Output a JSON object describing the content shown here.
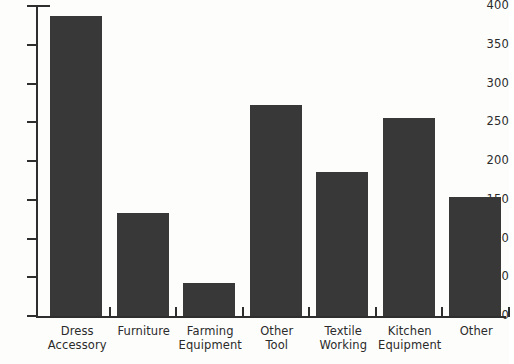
{
  "chart_data": {
    "type": "bar",
    "title": "",
    "subtitle": "",
    "xlabel": "",
    "ylabel": "",
    "ylim": [
      0,
      400
    ],
    "y_ticks": [
      0,
      50,
      100,
      150,
      200,
      250,
      300,
      350,
      400
    ],
    "grid": false,
    "legend": false,
    "legend_position": "none",
    "orientation": "vertical",
    "bar_color": "#383838",
    "background_color": "#fdfdfc",
    "axis_color": "#2e2e2e",
    "categories": [
      "Dress Accessory",
      "Furniture",
      "Farming Equipment",
      "Other Tool",
      "Textile Working",
      "Kitchen Equipment",
      "Other"
    ],
    "category_lines": [
      [
        "Dress",
        "Accessory"
      ],
      [
        "Furniture",
        ""
      ],
      [
        "Farming",
        "Equipment"
      ],
      [
        "Other",
        "Tool"
      ],
      [
        "Textile",
        "Working"
      ],
      [
        "Kitchen",
        "Equipment"
      ],
      [
        "Other",
        ""
      ]
    ],
    "values": [
      387,
      133,
      43,
      272,
      186,
      256,
      153
    ],
    "series": [
      {
        "name": "Count",
        "values": [
          387,
          133,
          43,
          272,
          186,
          256,
          153
        ]
      }
    ]
  },
  "axis": {
    "y_tick_labels": [
      "0",
      "50",
      "100",
      "150",
      "200",
      "250",
      "300",
      "350",
      "400"
    ]
  }
}
